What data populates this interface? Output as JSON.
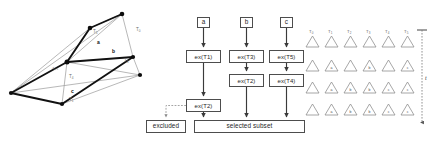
{
  "figure": {
    "panels": [
      "graph",
      "flowchart",
      "triangle-grid"
    ]
  },
  "graph": {
    "nodes": [
      {
        "id": "n0",
        "x": 11,
        "y": 93
      },
      {
        "id": "n1",
        "x": 62,
        "y": 104
      },
      {
        "id": "n2",
        "x": 67,
        "y": 62
      },
      {
        "id": "n3",
        "x": 90,
        "y": 28
      },
      {
        "id": "n4",
        "x": 122,
        "y": 14
      },
      {
        "id": "n5",
        "x": 133,
        "y": 57
      },
      {
        "id": "n6",
        "x": 140,
        "y": 75
      }
    ],
    "thin_edges": [
      [
        "n0",
        "n4"
      ],
      [
        "n0",
        "n2"
      ],
      [
        "n0",
        "n3"
      ],
      [
        "n0",
        "n6"
      ],
      [
        "n1",
        "n6"
      ],
      [
        "n2",
        "n4"
      ],
      [
        "n2",
        "n5"
      ],
      [
        "n2",
        "n6"
      ],
      [
        "n3",
        "n4"
      ],
      [
        "n5",
        "n6"
      ]
    ],
    "thick_edges": [
      [
        "n0",
        "n1"
      ],
      [
        "n1",
        "n5"
      ],
      [
        "n2",
        "n3"
      ],
      [
        "n2",
        "n5"
      ],
      [
        "n3",
        "n4"
      ],
      [
        "n0",
        "n2"
      ]
    ],
    "labels": [
      {
        "text": "T",
        "sub": "5",
        "x": 93,
        "y": 33,
        "style": "gray"
      },
      {
        "text": "T",
        "sub": "0",
        "x": 136,
        "y": 31,
        "style": "gray"
      },
      {
        "text": "T",
        "sub": "3",
        "x": 124,
        "y": 62,
        "style": "gray"
      },
      {
        "text": "T",
        "sub": "0",
        "x": 54,
        "y": 71,
        "style": "gray"
      },
      {
        "text": "T",
        "sub": "4",
        "x": 69,
        "y": 78,
        "style": "gray"
      },
      {
        "text": "T",
        "sub": "1",
        "x": 69,
        "y": 101,
        "style": "gray"
      },
      {
        "text": "a",
        "sub": "",
        "x": 97,
        "y": 44,
        "style": "dark"
      },
      {
        "text": "b",
        "sub": "",
        "x": 112,
        "y": 53,
        "style": "dark"
      },
      {
        "text": "c",
        "sub": "",
        "x": 71,
        "y": 93,
        "style": "dark"
      }
    ]
  },
  "flowchart": {
    "inputs": [
      {
        "label": "a",
        "x": 197,
        "y": 17,
        "w": 13,
        "h": 11
      },
      {
        "label": "b",
        "x": 240,
        "y": 17,
        "w": 13,
        "h": 11
      },
      {
        "label": "c",
        "x": 280,
        "y": 17,
        "w": 13,
        "h": 11
      }
    ],
    "stages": [
      {
        "label": "ex(T1)",
        "x": 186,
        "y": 50,
        "w": 35,
        "h": 13
      },
      {
        "label": "ex(T3)",
        "x": 229,
        "y": 50,
        "w": 35,
        "h": 13
      },
      {
        "label": "ex(T5)",
        "x": 269,
        "y": 50,
        "w": 35,
        "h": 13
      },
      {
        "label": "ex(T2)",
        "x": 229,
        "y": 74,
        "w": 35,
        "h": 13
      },
      {
        "label": "ex(T4)",
        "x": 269,
        "y": 74,
        "w": 35,
        "h": 13
      },
      {
        "label": "ex(T2)",
        "x": 186,
        "y": 99,
        "w": 35,
        "h": 13
      }
    ],
    "outputs": [
      {
        "label": "excluded",
        "x": 146,
        "y": 120,
        "w": 40,
        "h": 13
      },
      {
        "label": "selected subset",
        "x": 194,
        "y": 120,
        "w": 111,
        "h": 13
      }
    ]
  },
  "triangle_grid": {
    "headers": [
      {
        "text": "T",
        "sub": "0"
      },
      {
        "text": "T",
        "sub": "1"
      },
      {
        "text": "T",
        "sub": "2"
      },
      {
        "text": "T",
        "sub": "3"
      },
      {
        "text": "T",
        "sub": "4"
      },
      {
        "text": "T",
        "sub": "5"
      }
    ],
    "rows": [
      [
        "",
        "a",
        "",
        "b",
        "",
        "c"
      ],
      [
        "",
        "a",
        "b",
        "b",
        "c",
        "c"
      ],
      [
        "",
        "a",
        "b",
        "b",
        "c",
        "c"
      ]
    ],
    "geometry": {
      "x0": 306,
      "dx": 19,
      "y_header_label": 24,
      "y_header_tri": 36,
      "row_y": [
        68,
        90,
        112
      ],
      "tri_w": 13,
      "tri_h": 11
    }
  },
  "time_axis": {
    "label": "t",
    "x": 422,
    "y_top": 30,
    "y_bottom": 128
  }
}
